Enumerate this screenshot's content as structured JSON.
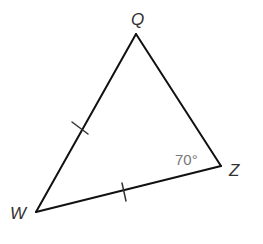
{
  "figure": {
    "type": "triangle",
    "vertices": [
      {
        "name": "Q",
        "label": "Q"
      },
      {
        "name": "Z",
        "label": "Z"
      },
      {
        "name": "W",
        "label": "W"
      }
    ],
    "angles": [
      {
        "vertex": "Z",
        "label": "70°"
      }
    ],
    "congruent_sides": [
      {
        "side": "WQ",
        "tick_marks": 1
      },
      {
        "side": "WZ",
        "tick_marks": 1
      }
    ]
  }
}
